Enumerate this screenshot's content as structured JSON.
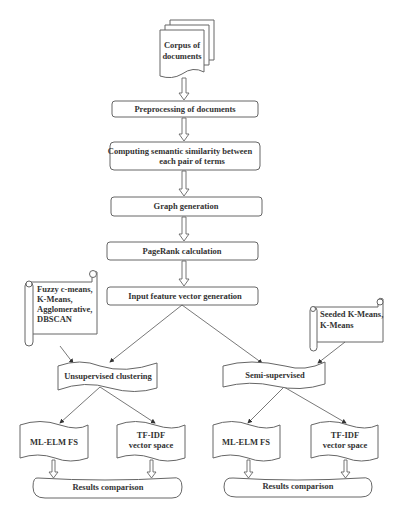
{
  "diagram": {
    "type": "flowchart",
    "source": {
      "label_lines": [
        "Corpus of",
        "documents"
      ],
      "shape": "multi-document"
    },
    "process_steps": [
      {
        "id": "preprocessing",
        "label_lines": [
          "Preprocessing of documents"
        ]
      },
      {
        "id": "semantic_similarity",
        "label_lines": [
          "Computing semantic similarity between",
          "each pair of terms"
        ]
      },
      {
        "id": "graph_generation",
        "label_lines": [
          "Graph generation"
        ]
      },
      {
        "id": "pagerank",
        "label_lines": [
          "PageRank calculation"
        ]
      },
      {
        "id": "input_vector",
        "label_lines": [
          "Input feature vector generation"
        ]
      }
    ],
    "annotations": [
      {
        "id": "unsupervised_methods",
        "shape": "scroll",
        "label_lines": [
          "Fuzzy c-means,",
          "K-Means,",
          "Agglomerative,",
          "DBSCAN"
        ],
        "points_to": "unsupervised"
      },
      {
        "id": "semisupervised_methods",
        "shape": "scroll",
        "label_lines": [
          "Seeded K-Means,",
          "K-Means"
        ],
        "points_to": "semisupervised"
      }
    ],
    "branches": [
      {
        "id": "unsupervised",
        "label": "Unsupervised clustering",
        "shape": "flag",
        "children": [
          {
            "id": "u_mlelm",
            "label_lines": [
              "ML-ELM FS"
            ],
            "shape": "document-wave"
          },
          {
            "id": "u_tfidf",
            "label_lines": [
              "TF-IDF",
              "vector space"
            ],
            "shape": "document-wave"
          }
        ],
        "result": {
          "label": "Results comparison",
          "shape": "oval"
        }
      },
      {
        "id": "semisupervised",
        "label": "Semi-supervised",
        "shape": "flag",
        "children": [
          {
            "id": "s_mlelm",
            "label_lines": [
              "ML-ELM FS"
            ],
            "shape": "document-wave"
          },
          {
            "id": "s_tfidf",
            "label_lines": [
              "TF-IDF",
              "vector space"
            ],
            "shape": "document-wave"
          }
        ],
        "result": {
          "label": "Results comparison",
          "shape": "oval"
        }
      }
    ],
    "colors": {
      "stroke": "#666666",
      "text": "#333333",
      "background": "#ffffff"
    }
  }
}
